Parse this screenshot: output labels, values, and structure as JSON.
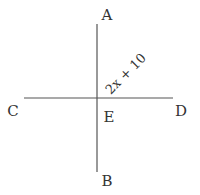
{
  "diagram": {
    "type": "intersecting-lines",
    "points": {
      "A": {
        "label": "A",
        "x": 107,
        "y": 20
      },
      "B": {
        "label": "B",
        "x": 107,
        "y": 181
      },
      "C": {
        "label": "C",
        "x": 13,
        "y": 111
      },
      "D": {
        "label": "D",
        "x": 181,
        "y": 111
      },
      "E": {
        "label": "E",
        "x": 109,
        "y": 117
      }
    },
    "lines": [
      {
        "name": "AB",
        "x1": 97,
        "y1": 24,
        "x2": 97,
        "y2": 172
      },
      {
        "name": "CD",
        "x1": 24,
        "y1": 98,
        "x2": 173,
        "y2": 98
      }
    ],
    "angle_label": {
      "text": "2x + 10",
      "x": 126,
      "y": 74,
      "rotation": -45
    },
    "colors": {
      "line": "#555555",
      "text": "#333333",
      "background": "#ffffff"
    }
  }
}
